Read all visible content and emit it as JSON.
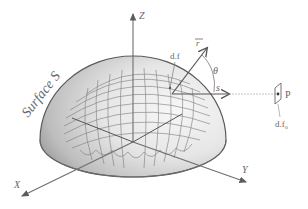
{
  "figure": {
    "surface_label": "Surface S",
    "axes": {
      "z": "Z",
      "x": "X",
      "y": "Y"
    },
    "element_label": "d.f",
    "vector_r_label": "r",
    "vector_s_label": "s",
    "angle_label": "θ",
    "point_label": "P",
    "point_element_label": "d.f",
    "point_element_subscript": "o",
    "colors": {
      "axis": "#6e6e6e",
      "outline": "#5a5a5a",
      "grid": "#7a7a7a",
      "shade_dark": "#8c8c8c",
      "shade_light": "#f4f4f4",
      "text": "#666666"
    }
  }
}
